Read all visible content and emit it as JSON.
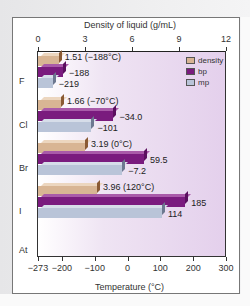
{
  "chart_data": {
    "type": "bar",
    "orientation": "horizontal",
    "title": "",
    "categories": [
      "F",
      "Cl",
      "Br",
      "I",
      "At"
    ],
    "series": [
      {
        "name": "density",
        "axis": "top",
        "unit": "g/mL",
        "values": [
          1.51,
          1.66,
          3.19,
          3.96,
          null
        ],
        "labels": [
          "1.51 (−188°C)",
          "1.66 (−70°C)",
          "3.19 (0°C)",
          "3.96 (120°C)",
          ""
        ],
        "color": "#d8b594"
      },
      {
        "name": "bp",
        "axis": "bottom",
        "unit": "°C",
        "values": [
          -188,
          -34.0,
          59.5,
          185,
          null
        ],
        "labels": [
          "−188",
          "−34.0",
          "59.5",
          "185",
          ""
        ],
        "color": "#7a1b7e"
      },
      {
        "name": "mp",
        "axis": "bottom",
        "unit": "°C",
        "values": [
          -219,
          -101,
          -7.2,
          114,
          null
        ],
        "labels": [
          "−219",
          "−101",
          "−7.2",
          "114",
          ""
        ],
        "color": "#b9c4d8"
      }
    ],
    "top_axis": {
      "label": "Density of liquid (g/mL)",
      "range": [
        0,
        12
      ],
      "ticks": [
        "0",
        "3",
        "6",
        "9",
        "12"
      ]
    },
    "bottom_axis": {
      "label": "Temperature  (°C)",
      "range": [
        -273,
        300
      ],
      "ticks": [
        "−273",
        "−200",
        "−100",
        "0",
        "100",
        "200",
        "300"
      ]
    },
    "legend": [
      "density",
      "bp",
      "mp"
    ],
    "legend_position": "top-right",
    "grid": false
  }
}
